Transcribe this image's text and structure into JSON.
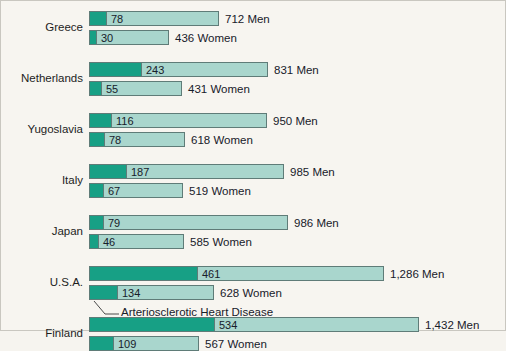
{
  "chart_data": {
    "type": "bar",
    "title": "",
    "subtitle": "",
    "xlabel": "",
    "ylabel": "",
    "grid": false,
    "legend_position": "none",
    "orientation": "horizontal",
    "stacked": true,
    "annotation": "Arteriosclerotic Heart Disease",
    "value_suffix_men": "Men",
    "value_suffix_women": "Women",
    "axis_origin_px": 88,
    "categories": [
      "Greece",
      "Netherlands",
      "Yugoslavia",
      "Italy",
      "Japan",
      "U.S.A.",
      "Finland"
    ],
    "series": [
      {
        "name": "Arteriosclerotic Heart Disease",
        "color": "#17a085"
      },
      {
        "name": "All other causes",
        "color": "#a9d6cd"
      }
    ],
    "rows": [
      {
        "category": "Greece",
        "sex": "Men",
        "ahd": 78,
        "total": 712,
        "ahd_label": "78",
        "total_label": "712 Men",
        "bar_px": 130,
        "ahd_px": 17
      },
      {
        "category": "Greece",
        "sex": "Women",
        "ahd": 30,
        "total": 436,
        "ahd_label": "30",
        "total_label": "436 Women",
        "bar_px": 80,
        "ahd_px": 7
      },
      {
        "category": "Netherlands",
        "sex": "Men",
        "ahd": 243,
        "total": 831,
        "ahd_label": "243",
        "total_label": "831 Men",
        "bar_px": 179,
        "ahd_px": 52
      },
      {
        "category": "Netherlands",
        "sex": "Women",
        "ahd": 55,
        "total": 431,
        "ahd_label": "55",
        "total_label": "431 Women",
        "bar_px": 93,
        "ahd_px": 12
      },
      {
        "category": "Yugoslavia",
        "sex": "Men",
        "ahd": 116,
        "total": 950,
        "ahd_label": "116",
        "total_label": "950 Men",
        "bar_px": 178,
        "ahd_px": 22
      },
      {
        "category": "Yugoslavia",
        "sex": "Women",
        "ahd": 78,
        "total": 618,
        "ahd_label": "78",
        "total_label": "618 Women",
        "bar_px": 96,
        "ahd_px": 15
      },
      {
        "category": "Italy",
        "sex": "Men",
        "ahd": 187,
        "total": 985,
        "ahd_label": "187",
        "total_label": "985 Men",
        "bar_px": 195,
        "ahd_px": 37
      },
      {
        "category": "Italy",
        "sex": "Women",
        "ahd": 67,
        "total": 519,
        "ahd_label": "67",
        "total_label": "519 Women",
        "bar_px": 94,
        "ahd_px": 14
      },
      {
        "category": "Japan",
        "sex": "Men",
        "ahd": 79,
        "total": 986,
        "ahd_label": "79",
        "total_label": "986 Men",
        "bar_px": 199,
        "ahd_px": 14
      },
      {
        "category": "Japan",
        "sex": "Women",
        "ahd": 46,
        "total": 585,
        "ahd_label": "46",
        "total_label": "585 Women",
        "bar_px": 95,
        "ahd_px": 9
      },
      {
        "category": "U.S.A.",
        "sex": "Men",
        "ahd": 461,
        "total": 1286,
        "ahd_label": "461",
        "total_label": "1,286 Men",
        "bar_px": 295,
        "ahd_px": 108
      },
      {
        "category": "U.S.A.",
        "sex": "Women",
        "ahd": 134,
        "total": 628,
        "ahd_label": "134",
        "total_label": "628 Women",
        "bar_px": 125,
        "ahd_px": 28
      },
      {
        "category": "Finland",
        "sex": "Men",
        "ahd": 534,
        "total": 1432,
        "ahd_label": "534",
        "total_label": "1,432 Men",
        "bar_px": 330,
        "ahd_px": 125
      },
      {
        "category": "Finland",
        "sex": "Women",
        "ahd": 109,
        "total": 567,
        "ahd_label": "109",
        "total_label": "567 Women",
        "bar_px": 110,
        "ahd_px": 24
      }
    ],
    "colors": {
      "ahd": "#17a085",
      "other": "#a9d6cd",
      "border": "#5f7c78",
      "background": "#f7f5f0",
      "text": "#17202a"
    }
  }
}
